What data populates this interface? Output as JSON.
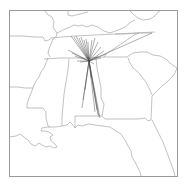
{
  "map": {
    "region": "Southeastern United States",
    "states_visible": [
      "Missouri",
      "Arkansas",
      "Louisiana",
      "Mississippi",
      "Alabama",
      "Tennessee",
      "Kentucky",
      "Georgia",
      "Florida",
      "South Carolina",
      "North Carolina",
      "Virginia",
      "Illinois",
      "Indiana"
    ],
    "hub_point": {
      "x": 89,
      "y": 61
    },
    "colors": {
      "background": "#ffffff",
      "borders": "#a8a8a8",
      "rays": "#4a4a4a",
      "frame": "#9a9a9a"
    },
    "ray_endpoints": [
      [
        71,
        36
      ],
      [
        74,
        37
      ],
      [
        76,
        36
      ],
      [
        79,
        38
      ],
      [
        81,
        37
      ],
      [
        84,
        40
      ],
      [
        86,
        39
      ],
      [
        88,
        42
      ],
      [
        92,
        40
      ],
      [
        95,
        38
      ],
      [
        98,
        42
      ],
      [
        101,
        47
      ],
      [
        104,
        51
      ],
      [
        106,
        54
      ],
      [
        68,
        50
      ],
      [
        72,
        53
      ],
      [
        75,
        56
      ],
      [
        77,
        61
      ],
      [
        80,
        62
      ],
      [
        98,
        56
      ],
      [
        101,
        58
      ],
      [
        94,
        64
      ],
      [
        83,
        100
      ],
      [
        82,
        108
      ],
      [
        85,
        90
      ],
      [
        91,
        78
      ],
      [
        95,
        112
      ],
      [
        98,
        115
      ],
      [
        99,
        117
      ],
      [
        100,
        118
      ],
      [
        97,
        110
      ],
      [
        152,
        33
      ]
    ]
  }
}
